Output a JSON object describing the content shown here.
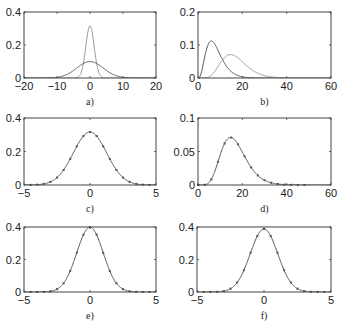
{
  "chart_data": [
    {
      "id": "a",
      "type": "line",
      "caption": "a)",
      "xlim": [
        -20,
        20
      ],
      "ylim": [
        0,
        0.4
      ],
      "xticks": [
        -20,
        -10,
        0,
        10,
        20
      ],
      "xtick_labels": [
        "−20",
        "−10",
        "0",
        "10",
        "20"
      ],
      "yticks": [
        0,
        0.2,
        0.4
      ],
      "ytick_labels": [
        "0",
        "0.2",
        "0.4"
      ],
      "series": [
        {
          "name": "narrow-normal",
          "dist": "normal",
          "mu": 0,
          "sigma": 1.26,
          "color": "#9a9a9a"
        },
        {
          "name": "wide-normal",
          "dist": "normal",
          "mu": 0,
          "sigma": 4.0,
          "color": "#555555"
        }
      ]
    },
    {
      "id": "b",
      "type": "line",
      "caption": "b)",
      "xlim": [
        0,
        60
      ],
      "ylim": [
        0,
        0.2
      ],
      "xticks": [
        0,
        20,
        40,
        60
      ],
      "xtick_labels": [
        "0",
        "20",
        "40",
        "60"
      ],
      "yticks": [
        0,
        0.1,
        0.2
      ],
      "ytick_labels": [
        "0",
        "0.1",
        "0.2"
      ],
      "series": [
        {
          "name": "gamma-left",
          "dist": "gamma",
          "k": 4,
          "theta": 2,
          "color": "#555555"
        },
        {
          "name": "gamma-right",
          "dist": "gamma",
          "k": 8,
          "theta": 2.1,
          "color": "#9a9a9a"
        }
      ]
    },
    {
      "id": "c",
      "type": "line+scatter",
      "caption": "c)",
      "xlim": [
        -5,
        5
      ],
      "ylim": [
        0,
        0.4
      ],
      "xticks": [
        -5,
        0,
        5
      ],
      "xtick_labels": [
        "−5",
        "0",
        "5"
      ],
      "yticks": [
        0,
        0.2,
        0.4
      ],
      "ytick_labels": [
        "0",
        "0.2",
        "0.4"
      ],
      "series": [
        {
          "name": "fit",
          "dist": "normal",
          "mu": 0,
          "sigma": 1.26,
          "color": "#555555"
        }
      ],
      "markers": {
        "x_start": -4.5,
        "x_end": 4.5,
        "step": 0.5
      }
    },
    {
      "id": "d",
      "type": "line+scatter",
      "caption": "d)",
      "xlim": [
        0,
        60
      ],
      "ylim": [
        0,
        0.1
      ],
      "xticks": [
        0,
        20,
        40,
        60
      ],
      "xtick_labels": [
        "0",
        "20",
        "40",
        "60"
      ],
      "yticks": [
        0,
        0.05,
        0.1
      ],
      "ytick_labels": [
        "0",
        "0.05",
        "0.1"
      ],
      "series": [
        {
          "name": "fit",
          "dist": "gamma",
          "k": 8,
          "theta": 2.1,
          "color": "#555555"
        }
      ],
      "markers": {
        "x_start": 0,
        "x_end": 48,
        "step": 3
      }
    },
    {
      "id": "e",
      "type": "line+scatter",
      "caption": "e)",
      "xlim": [
        -5,
        5
      ],
      "ylim": [
        0,
        0.4
      ],
      "xticks": [
        -5,
        0,
        5
      ],
      "xtick_labels": [
        "−5",
        "0",
        "5"
      ],
      "yticks": [
        0,
        0.2,
        0.4
      ],
      "ytick_labels": [
        "0",
        "0.2",
        "0.4"
      ],
      "series": [
        {
          "name": "fit",
          "dist": "normal",
          "mu": 0,
          "sigma": 1.0,
          "color": "#555555"
        }
      ],
      "markers": {
        "x_start": -4.5,
        "x_end": 4.5,
        "step": 0.5
      }
    },
    {
      "id": "f",
      "type": "line+scatter",
      "caption": "f)",
      "xlim": [
        -5,
        5
      ],
      "ylim": [
        0,
        0.4
      ],
      "xticks": [
        -5,
        0,
        5
      ],
      "xtick_labels": [
        "−5",
        "0",
        "5"
      ],
      "yticks": [
        0,
        0.2,
        0.4
      ],
      "ytick_labels": [
        "0",
        "0.2",
        "0.4"
      ],
      "series": [
        {
          "name": "fit",
          "dist": "normal",
          "mu": 0,
          "sigma": 1.03,
          "color": "#555555"
        }
      ],
      "markers": {
        "x_start": -4.5,
        "x_end": 4.5,
        "step": 0.5
      }
    }
  ]
}
